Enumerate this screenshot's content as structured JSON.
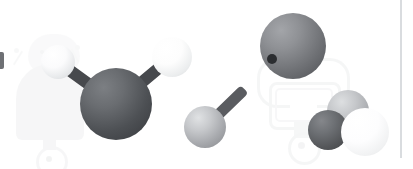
{
  "scene": {
    "title": "Molecular ball-and-stick illustration",
    "background_color": "#ffffff",
    "width": 413,
    "height": 169,
    "alt_text": "Three grey and white spheres joined by dark sticks forming a water-like molecule, a single grey sphere on a stick, a large grey sphere with a dark spot, and a cluster of three overlapping spheres, over faint robot watermarks."
  },
  "divider": {
    "name": "right-divider-line",
    "color": "#d9dcdf",
    "x": 400,
    "y": 0,
    "width": 2,
    "height": 158
  },
  "left_clip_mark": {
    "name": "clipped-left-glyph",
    "color": "#6e7074",
    "x": 0,
    "y": 52,
    "width": 4,
    "height": 17
  },
  "watermarks": [
    {
      "id": "wm-left-robot",
      "label": "faint robot watermark left",
      "color": "#d8dadc",
      "opacity": 0.22
    },
    {
      "id": "wm-left-bug",
      "label": "faint bug head watermark left",
      "color": "#e2e4e6",
      "opacity": 0.22
    },
    {
      "id": "wm-right-robot",
      "label": "faint robot watermark right",
      "color": "#e0e2e4",
      "opacity": 0.3
    }
  ],
  "molecules": [
    {
      "id": "molecule-water",
      "label": "water-like molecule",
      "atoms": [
        {
          "id": "atom-center-dark",
          "label": "central dark atom",
          "color_light": "#6f7276",
          "color_dark": "#3b3d41",
          "cx": 116,
          "cy": 104,
          "r": 36
        },
        {
          "id": "atom-upper-right-white",
          "label": "upper right white atom",
          "color_light": "#ffffff",
          "color_dark": "#dcdee0",
          "cx": 172,
          "cy": 57,
          "r": 20
        },
        {
          "id": "atom-upper-left-white",
          "label": "upper left white atom",
          "color_light": "#ffffff",
          "color_dark": "#d5d7d9",
          "cx": 58,
          "cy": 62,
          "r": 17
        }
      ],
      "bonds": [
        {
          "id": "bond-center-to-upper-right",
          "color": "#47494d",
          "x1": 116,
          "y1": 104,
          "x2": 172,
          "y2": 57,
          "thickness": 12
        },
        {
          "id": "bond-center-to-upper-left",
          "color": "#47494d",
          "x1": 116,
          "y1": 104,
          "x2": 64,
          "y2": 66,
          "thickness": 12
        }
      ]
    },
    {
      "id": "molecule-single",
      "label": "single atom with stick",
      "atoms": [
        {
          "id": "atom-mid-grey",
          "label": "middle grey atom",
          "color_light": "#d3d5d7",
          "color_dark": "#8f9195",
          "cx": 205,
          "cy": 127,
          "r": 21
        }
      ],
      "bonds": [
        {
          "id": "bond-mid-stick",
          "color": "#5a5c60",
          "x1": 205,
          "y1": 127,
          "x2": 244,
          "y2": 89,
          "thickness": 11
        }
      ]
    },
    {
      "id": "molecule-large",
      "label": "large spotted atom",
      "atoms": [
        {
          "id": "atom-large-grey",
          "label": "large grey atom with spot",
          "color_light": "#8e9094",
          "color_dark": "#56585c",
          "cx": 293,
          "cy": 46,
          "r": 33
        }
      ],
      "spot": {
        "id": "atom-large-spot",
        "label": "dark spot marker",
        "color": "#2b2d30",
        "cx": 272,
        "cy": 59,
        "r": 5
      },
      "bonds": []
    },
    {
      "id": "molecule-cluster",
      "label": "cluster of three atoms",
      "atoms": [
        {
          "id": "atom-cluster-back-grey",
          "label": "back grey atom",
          "color_light": "#d0d2d4",
          "color_dark": "#96989c",
          "cx": 348,
          "cy": 111,
          "r": 21
        },
        {
          "id": "atom-cluster-dark",
          "label": "left dark atom",
          "color_light": "#76787c",
          "color_dark": "#46484c",
          "cx": 328,
          "cy": 130,
          "r": 20
        },
        {
          "id": "atom-cluster-white",
          "label": "front white atom",
          "color_light": "#ffffff",
          "color_dark": "#e3e5e7",
          "cx": 365,
          "cy": 132,
          "r": 24
        }
      ],
      "bonds": []
    }
  ]
}
